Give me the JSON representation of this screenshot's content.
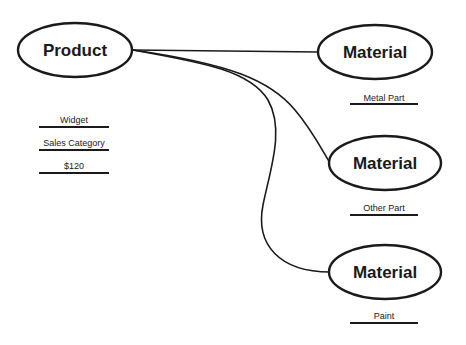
{
  "diagram": {
    "colors": {
      "stroke": "#1a1a1a",
      "background": "#ffffff"
    },
    "product": {
      "label": "Product",
      "attributes": [
        {
          "label": "Widget"
        },
        {
          "label": "Sales Category"
        },
        {
          "label": "$120"
        }
      ]
    },
    "materials": [
      {
        "label": "Material",
        "attribute": "Metal Part"
      },
      {
        "label": "Material",
        "attribute": "Other Part"
      },
      {
        "label": "Material",
        "attribute": "Paint"
      }
    ]
  }
}
